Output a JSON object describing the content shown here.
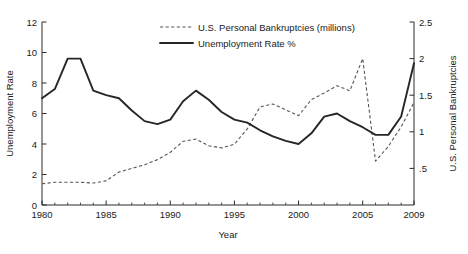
{
  "chart_data": {
    "type": "line",
    "title": "",
    "xlabel": "Year",
    "ylabel": "Unemployment Rate",
    "y2label": "U.S. Personal Bankruptcies",
    "xlim": [
      1980,
      2009
    ],
    "ylim": [
      0,
      12
    ],
    "y2lim": [
      0,
      2.5
    ],
    "grid": false,
    "legend_position": "top-center",
    "x_ticks": [
      1980,
      1985,
      1990,
      1995,
      2000,
      2005,
      2009
    ],
    "x_tick_labels": [
      "1980",
      "1985",
      "1990",
      "1995",
      "2000",
      "2005",
      "2009"
    ],
    "x_minor_tick_interval": 1,
    "y_ticks": [
      0,
      2,
      4,
      6,
      8,
      10,
      12
    ],
    "y_tick_labels": [
      "0",
      "2",
      "4",
      "6",
      "8",
      "10",
      "12"
    ],
    "y2_ticks": [
      0.5,
      1,
      1.5,
      2,
      2.5
    ],
    "y2_tick_labels": [
      ".5",
      "1",
      "1.5",
      "2",
      "2.5"
    ],
    "x": [
      1980,
      1981,
      1982,
      1983,
      1984,
      1985,
      1986,
      1987,
      1988,
      1989,
      1990,
      1991,
      1992,
      1993,
      1994,
      1995,
      1996,
      1997,
      1998,
      1999,
      2000,
      2001,
      2002,
      2003,
      2004,
      2005,
      2006,
      2007,
      2008,
      2009
    ],
    "series": [
      {
        "name": "U.S. Personal Bankruptcies (millions)",
        "axis": "right",
        "style": "dashed",
        "color": "#555555",
        "units": "millions",
        "values": [
          0.29,
          0.31,
          0.31,
          0.31,
          0.3,
          0.33,
          0.45,
          0.5,
          0.55,
          0.62,
          0.72,
          0.87,
          0.9,
          0.81,
          0.78,
          0.83,
          1.04,
          1.34,
          1.38,
          1.3,
          1.22,
          1.44,
          1.53,
          1.63,
          1.56,
          2.0,
          0.6,
          0.8,
          1.07,
          1.4
        ]
      },
      {
        "name": "Unemployment Rate %",
        "axis": "left",
        "style": "solid",
        "color": "#262626",
        "units": "percent",
        "values": [
          7.0,
          7.6,
          9.6,
          9.6,
          7.5,
          7.2,
          7.0,
          6.2,
          5.5,
          5.3,
          5.6,
          6.8,
          7.5,
          6.9,
          6.1,
          5.6,
          5.4,
          4.9,
          4.5,
          4.2,
          4.0,
          4.7,
          5.8,
          6.0,
          5.5,
          5.1,
          4.6,
          4.6,
          5.8,
          9.3
        ]
      }
    ]
  },
  "legend": {
    "entries": [
      {
        "label": "U.S. Personal Bankruptcies (millions)",
        "style": "dashed"
      },
      {
        "label": "Unemployment Rate %",
        "style": "solid"
      }
    ]
  },
  "axes": {
    "x_title": "Year",
    "y_left_title": "Unemployment Rate",
    "y_right_title": "U.S. Personal Bankruptcies"
  }
}
